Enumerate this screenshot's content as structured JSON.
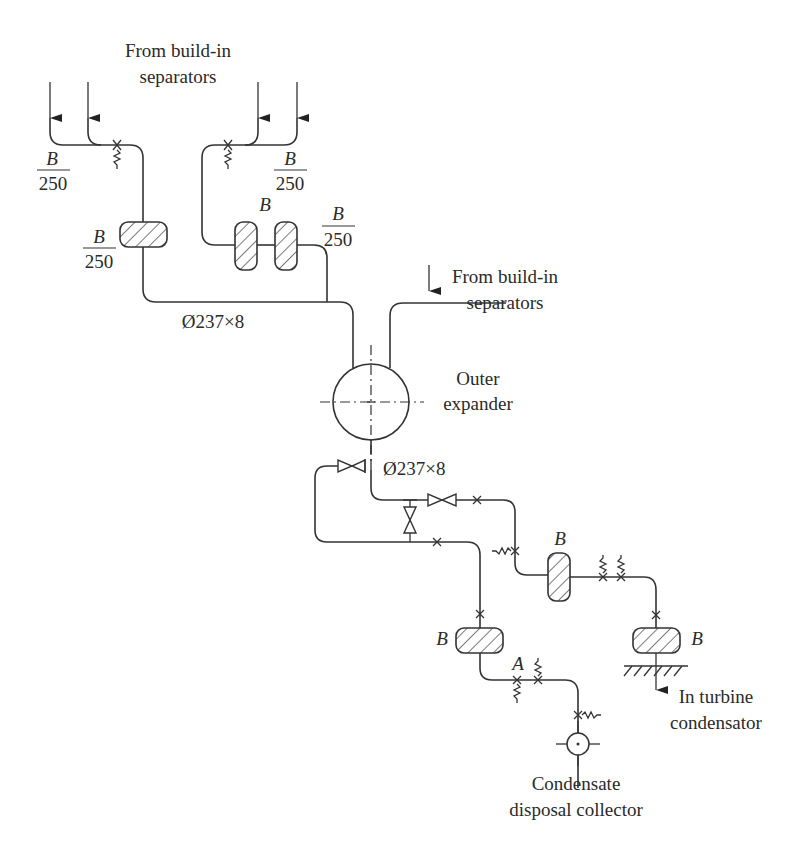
{
  "diagram": {
    "type": "piping schematic",
    "labels": {
      "top_source": [
        "From build-in",
        "separators"
      ],
      "right_source": [
        "From build-in",
        "separators"
      ],
      "expander": [
        "Outer",
        "expander"
      ],
      "header_size_top": "Ø237×8",
      "header_size_bottom": "Ø237×8",
      "turbine": [
        "In turbine",
        "condensator"
      ],
      "collector": [
        "Condensate",
        "disposal collector"
      ]
    },
    "fractions": {
      "left_top": {
        "num": "B",
        "den": "250"
      },
      "left_filter": {
        "num": "B",
        "den": "250"
      },
      "right_top": {
        "num": "B",
        "den": "250"
      },
      "right_after_filters": {
        "num": "B",
        "den": "250"
      }
    },
    "component_labels": {
      "twin_filters": "B",
      "mid_filter": "B",
      "lower_left_filter": "B",
      "lower_right_filter": "B",
      "valve_a": "A"
    }
  }
}
